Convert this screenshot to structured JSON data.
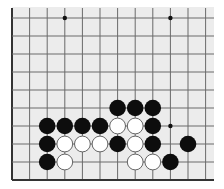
{
  "board": {
    "background": "#ececec",
    "line_color": "#6a6a6a",
    "edge_color": "#333333",
    "area": {
      "x0": 12,
      "y0": 7,
      "x1": 214,
      "y1": 180
    },
    "columns_x": [
      12,
      29.6,
      47.2,
      64.8,
      82.4,
      100,
      117.6,
      135.2,
      152.8,
      170.4,
      188,
      205.6
    ],
    "rows_y": [
      18,
      36,
      54,
      72,
      90,
      108,
      126,
      144,
      162,
      180
    ],
    "edges": {
      "left": true,
      "bottom": true,
      "top": false,
      "right": false
    },
    "star_points": [
      [
        3,
        0
      ],
      [
        9,
        0
      ],
      [
        9,
        6
      ]
    ],
    "stone_radius": 8.3,
    "stones": [
      {
        "col": 6,
        "row": 5,
        "color": "black"
      },
      {
        "col": 7,
        "row": 5,
        "color": "black"
      },
      {
        "col": 8,
        "row": 5,
        "color": "black"
      },
      {
        "col": 2,
        "row": 6,
        "color": "black"
      },
      {
        "col": 3,
        "row": 6,
        "color": "black"
      },
      {
        "col": 4,
        "row": 6,
        "color": "black"
      },
      {
        "col": 5,
        "row": 6,
        "color": "black"
      },
      {
        "col": 6,
        "row": 6,
        "color": "white"
      },
      {
        "col": 7,
        "row": 6,
        "color": "white"
      },
      {
        "col": 8,
        "row": 6,
        "color": "black"
      },
      {
        "col": 2,
        "row": 7,
        "color": "black"
      },
      {
        "col": 3,
        "row": 7,
        "color": "white"
      },
      {
        "col": 4,
        "row": 7,
        "color": "white"
      },
      {
        "col": 5,
        "row": 7,
        "color": "white"
      },
      {
        "col": 6,
        "row": 7,
        "color": "black"
      },
      {
        "col": 7,
        "row": 7,
        "color": "white"
      },
      {
        "col": 8,
        "row": 7,
        "color": "black"
      },
      {
        "col": 10,
        "row": 7,
        "color": "black"
      },
      {
        "col": 2,
        "row": 8,
        "color": "black"
      },
      {
        "col": 3,
        "row": 8,
        "color": "white"
      },
      {
        "col": 7,
        "row": 8,
        "color": "white"
      },
      {
        "col": 8,
        "row": 8,
        "color": "white"
      },
      {
        "col": 9,
        "row": 8,
        "color": "black"
      }
    ]
  }
}
